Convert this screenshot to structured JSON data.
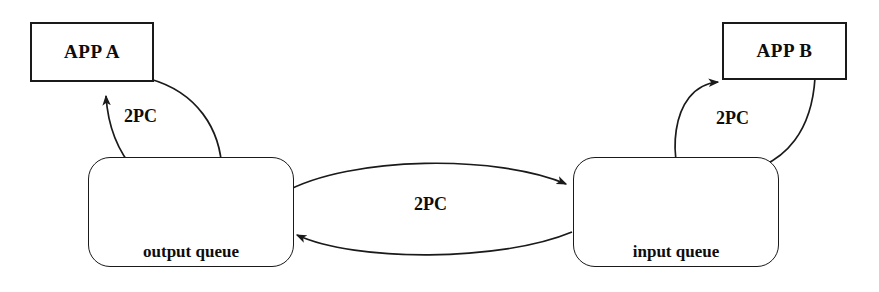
{
  "diagram": {
    "stroke_color": "#1a1a1a",
    "background_color": "#ffffff",
    "nodes": {
      "app_a": {
        "label": "APP A",
        "shape": "rectangle"
      },
      "app_b": {
        "label": "APP B",
        "shape": "rectangle"
      },
      "output_queue": {
        "label": "output queue",
        "shape": "rounded-rectangle",
        "cells": 4
      },
      "input_queue": {
        "label": "input queue",
        "shape": "rounded-rectangle",
        "cells": 4
      }
    },
    "edge_labels": {
      "app_a_to_output_queue": "2PC",
      "output_queue_to_input_queue": "2PC",
      "input_queue_to_app_b": "2PC"
    },
    "edges": [
      {
        "name": "app-a-to-output-queue",
        "from": "app_a",
        "to": "output_queue",
        "label": "2PC",
        "style": "curved-arrow"
      },
      {
        "name": "output-queue-to-app-a",
        "from": "output_queue",
        "to": "app_a",
        "label": "2PC",
        "style": "curved-arrow"
      },
      {
        "name": "output-queue-to-input-queue",
        "from": "output_queue",
        "to": "input_queue",
        "label": "2PC",
        "style": "arc-arrow"
      },
      {
        "name": "input-queue-to-output-queue",
        "from": "input_queue",
        "to": "output_queue",
        "label": "2PC",
        "style": "arc-arrow"
      },
      {
        "name": "input-queue-to-app-b",
        "from": "input_queue",
        "to": "app_b",
        "label": "2PC",
        "style": "curved-arrow"
      },
      {
        "name": "app-b-to-input-queue",
        "from": "app_b",
        "to": "input_queue",
        "label": "2PC",
        "style": "curved-arrow"
      }
    ]
  }
}
